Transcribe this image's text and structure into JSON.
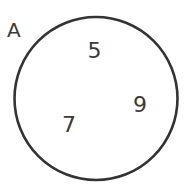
{
  "diagram": {
    "type": "venn",
    "sets": [
      {
        "label": "A",
        "elements": [
          "5",
          "9",
          "7"
        ],
        "stroke_color": "#333333"
      }
    ],
    "colors": {
      "background": "#ffffff",
      "stroke": "#333333",
      "text": "#3a3a3a"
    }
  }
}
